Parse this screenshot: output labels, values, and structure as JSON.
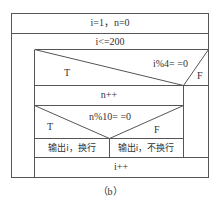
{
  "diagram": {
    "type": "nassi-shneiderman",
    "caption": "（b）",
    "init": "i=1，n=0",
    "loop_condition": "i<=200",
    "if1": {
      "condition": "i%4= =0",
      "true_label": "T",
      "false_label": "F"
    },
    "true_branch_stmt": "n++",
    "if2": {
      "condition": "n%10= =0",
      "true_label": "T",
      "false_label": "F",
      "true_stmt": "输出i，换行",
      "false_stmt": "输出i，不换行"
    },
    "increment": "i++"
  },
  "colors": {
    "line": "#555555",
    "text": "#333333",
    "background": "#ffffff"
  }
}
